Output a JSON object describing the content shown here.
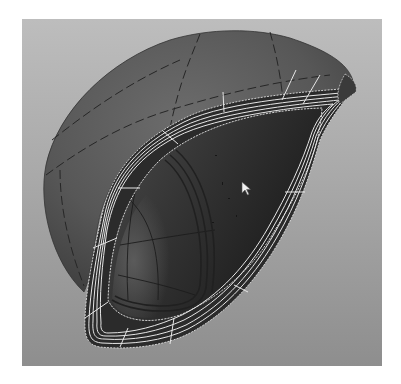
{
  "viewport": {
    "label": "3D perspective viewport",
    "background_top": "#bdbdbd",
    "background_bottom": "#8e8e8e"
  },
  "model": {
    "type": "NURBS shell surface with offset rim",
    "shell_color": "#5e5e5e",
    "inner_color": "#2a2a2a",
    "rim_color": "#2b2b2b",
    "rim_isoparm_color": "#e6e6e6",
    "shell_isoparm_color": "#262626",
    "rim_isoparm_count": 5
  },
  "cursor": {
    "icon": "arrow-pointer-icon",
    "x": 243,
    "y": 183
  }
}
